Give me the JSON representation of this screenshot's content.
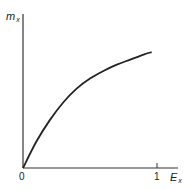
{
  "chart_data": {
    "type": "line",
    "title": "",
    "xlabel": "E",
    "xlabel_sub": "x",
    "ylabel": "m",
    "ylabel_sub": "x",
    "x_ticks": [
      {
        "value": 0,
        "label": "0"
      },
      {
        "value": 1,
        "label": "1"
      }
    ],
    "y_ticks": [],
    "xlim": [
      0,
      1.2
    ],
    "ylim": [
      0,
      1.0
    ],
    "grid": false,
    "legend": null,
    "series": [
      {
        "name": "m_x vs E_x",
        "color": "#222222",
        "x": [
          0,
          0.1,
          0.2,
          0.3,
          0.4,
          0.5,
          0.6,
          0.7,
          0.8,
          0.9,
          0.96
        ],
        "y": [
          0,
          0.21,
          0.38,
          0.52,
          0.63,
          0.71,
          0.77,
          0.82,
          0.86,
          0.9,
          0.92
        ]
      }
    ]
  }
}
